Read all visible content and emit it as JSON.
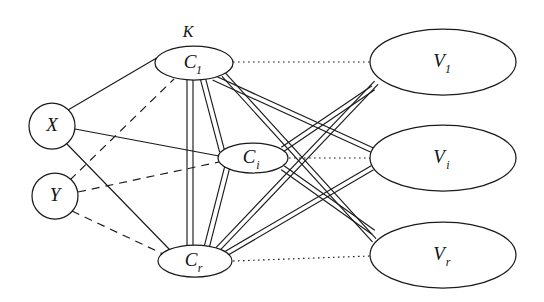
{
  "figure": {
    "kind": "bipartite-tripartite-graph-diagram",
    "width": 544,
    "height": 302,
    "background_color": "#ffffff",
    "ink_color": "#1b1b1b"
  },
  "set_labels": [
    {
      "id": "K",
      "text": "K",
      "x": 188,
      "y": 33
    }
  ],
  "nodes": {
    "left": [
      {
        "id": "X",
        "shape": "circle",
        "base": "X",
        "sub": "",
        "cx": 52,
        "cy": 126,
        "r": 23
      },
      {
        "id": "Y",
        "shape": "circle",
        "base": "Y",
        "sub": "",
        "cx": 55,
        "cy": 196,
        "r": 23
      }
    ],
    "middle": [
      {
        "id": "C1",
        "shape": "ellipse",
        "base": "C",
        "sub": "1",
        "cx": 194,
        "cy": 63,
        "rx": 39,
        "ry": 17
      },
      {
        "id": "Ci",
        "shape": "ellipse",
        "base": "C",
        "sub": "i",
        "cx": 253,
        "cy": 158,
        "rx": 35,
        "ry": 15
      },
      {
        "id": "Cr",
        "shape": "ellipse",
        "base": "C",
        "sub": "r",
        "cx": 195,
        "cy": 261,
        "rx": 37,
        "ry": 16
      }
    ],
    "right": [
      {
        "id": "V1",
        "shape": "ellipse",
        "base": "V",
        "sub": "1",
        "cx": 443,
        "cy": 62,
        "rx": 73,
        "ry": 33
      },
      {
        "id": "Vi",
        "shape": "ellipse",
        "base": "V",
        "sub": "i",
        "cx": 443,
        "cy": 158,
        "rx": 73,
        "ry": 33
      },
      {
        "id": "Vr",
        "shape": "ellipse",
        "base": "V",
        "sub": "r",
        "cx": 443,
        "cy": 255,
        "rx": 73,
        "ry": 33
      }
    ]
  },
  "edges": {
    "solid_from_X": [
      {
        "from": "X",
        "to": "C1",
        "x1": 68,
        "y1": 110,
        "x2": 160,
        "y2": 56
      },
      {
        "from": "X",
        "to": "Ci",
        "x1": 75,
        "y1": 129,
        "x2": 219,
        "y2": 156
      },
      {
        "from": "X",
        "to": "Cr",
        "x1": 66,
        "y1": 143,
        "x2": 170,
        "y2": 250
      }
    ],
    "dashed_from_Y": [
      {
        "from": "Y",
        "to": "C1",
        "x1": 70,
        "y1": 180,
        "x2": 174,
        "y2": 79
      },
      {
        "from": "Y",
        "to": "Ci",
        "x1": 78,
        "y1": 192,
        "x2": 219,
        "y2": 162
      },
      {
        "from": "Y",
        "to": "Cr",
        "x1": 72,
        "y1": 211,
        "x2": 163,
        "y2": 254
      }
    ],
    "double_middle": [
      {
        "from": "C1",
        "to": "Cr",
        "x1": 190,
        "y1": 80,
        "x2": 190,
        "y2": 246,
        "offset": 3.0
      },
      {
        "from": "C1",
        "to": "Ci",
        "x1": 203,
        "y1": 79,
        "x2": 222,
        "y2": 151,
        "offset": 2.6
      },
      {
        "from": "Ci",
        "to": "Cr",
        "x1": 227,
        "y1": 168,
        "x2": 207,
        "y2": 246,
        "offset": 2.6
      }
    ],
    "double_to_right": [
      {
        "from": "C1",
        "to": "Vi",
        "x1": 214,
        "y1": 78,
        "x2": 372,
        "y2": 150,
        "offset": 2.4
      },
      {
        "from": "C1",
        "to": "Vr",
        "x1": 224,
        "y1": 75,
        "x2": 374,
        "y2": 240,
        "offset": 2.4
      },
      {
        "from": "Cr",
        "to": "V1",
        "x1": 217,
        "y1": 250,
        "x2": 376,
        "y2": 83,
        "offset": 2.4
      },
      {
        "from": "Cr",
        "to": "Vi",
        "x1": 227,
        "y1": 253,
        "x2": 372,
        "y2": 168,
        "offset": 2.4
      },
      {
        "from": "Ci",
        "to": "V1",
        "x1": 283,
        "y1": 149,
        "x2": 373,
        "y2": 88,
        "offset": 2.4
      },
      {
        "from": "Ci",
        "to": "Vr",
        "x1": 283,
        "y1": 168,
        "x2": 373,
        "y2": 232,
        "offset": 2.4
      }
    ],
    "dotted_correspondence": [
      {
        "from": "C1",
        "to": "V1",
        "x1": 233,
        "y1": 62,
        "x2": 370,
        "y2": 62
      },
      {
        "from": "Ci",
        "to": "Vi",
        "x1": 289,
        "y1": 158,
        "x2": 370,
        "y2": 158
      },
      {
        "from": "Cr",
        "to": "Vr",
        "x1": 233,
        "y1": 261,
        "x2": 370,
        "y2": 256
      }
    ]
  }
}
